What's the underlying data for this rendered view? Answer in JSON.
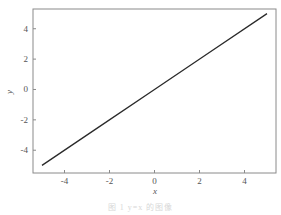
{
  "chart_data": {
    "type": "line",
    "title": "",
    "xlabel": "x",
    "ylabel": "y",
    "xlim": [
      -5.4,
      5.4
    ],
    "ylim": [
      -5.5,
      5.3
    ],
    "xticks": [
      -4,
      -2,
      0,
      2,
      4
    ],
    "yticks": [
      -4,
      -2,
      0,
      2,
      4
    ],
    "xtick_labels": [
      "-4",
      "-2",
      "0",
      "2",
      "4"
    ],
    "ytick_labels": [
      "-4",
      "-2",
      "0",
      "2",
      "4"
    ],
    "grid": false,
    "legend": null,
    "series": [
      {
        "name": "y = x",
        "x": [
          -5,
          -2.5,
          0,
          2.5,
          5
        ],
        "values": [
          -5,
          -2.5,
          0,
          2.5,
          5
        ],
        "color": "#2a2a2a"
      }
    ]
  },
  "caption": "图 1   y=x 的图像",
  "colors": {
    "frame": "#8a8a8a",
    "line": "#2a2a2a",
    "text": "#555555"
  }
}
